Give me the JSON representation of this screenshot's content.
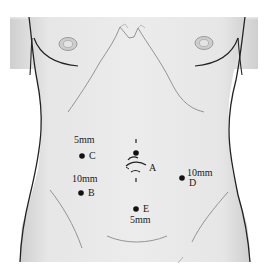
{
  "diagram": {
    "type": "anatomical-torso-port-placement",
    "colors": {
      "skin": "#e9e9e9",
      "skin_shade": "#d6d6d6",
      "outline": "#222222",
      "thin_line": "#7a7a7a",
      "port_dot": "#111111",
      "text": "#1a1a1a"
    },
    "ports": [
      {
        "id": "A",
        "letter": "A",
        "size": "",
        "x": 135,
        "y": 181
      },
      {
        "id": "B",
        "letter": "B",
        "size": "10mm",
        "x": 81,
        "y": 192
      },
      {
        "id": "C",
        "letter": "C",
        "size": "5mm",
        "x": 82,
        "y": 155
      },
      {
        "id": "D",
        "letter": "D",
        "size": "10mm",
        "x": 182,
        "y": 177
      },
      {
        "id": "E",
        "letter": "E",
        "size": "5mm",
        "x": 136,
        "y": 208
      }
    ],
    "labels": {
      "A": "A",
      "B": "B",
      "C": "C",
      "D": "D",
      "E": "E",
      "size_B": "10mm",
      "size_C": "5mm",
      "size_D": "10mm",
      "size_E": "5mm"
    },
    "annotations": {
      "umbilicus_marker": "umbilicus-incision-mark"
    }
  }
}
